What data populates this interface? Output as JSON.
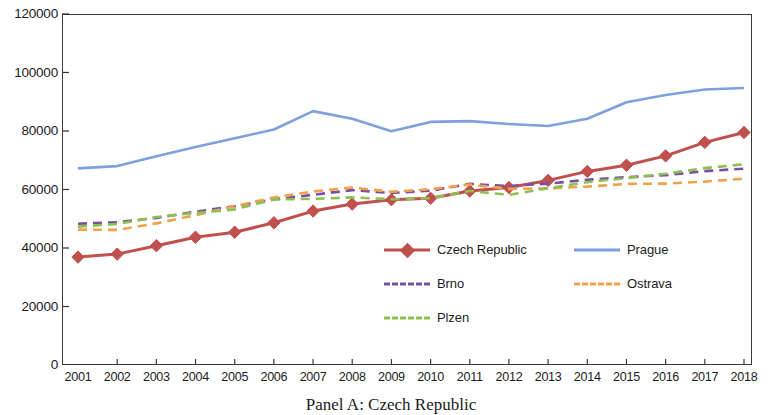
{
  "caption": "Panel A: Czech Republic",
  "axes": {
    "y_ticks": [
      "0",
      "20000",
      "40000",
      "60000",
      "80000",
      "100000",
      "120000"
    ],
    "x_ticks": [
      "2001",
      "2002",
      "2003",
      "2004",
      "2005",
      "2006",
      "2007",
      "2008",
      "2009",
      "2010",
      "2011",
      "2012",
      "2013",
      "2014",
      "2015",
      "2016",
      "2017",
      "2018"
    ],
    "xlabel": "",
    "ylabel": ""
  },
  "legend": {
    "position": "inside-center-lower",
    "entries": [
      {
        "label": "Czech Republic",
        "color": "#C0504D",
        "style": "solid-marker",
        "marker": "diamond"
      },
      {
        "label": "Prague",
        "color": "#7FA0DC",
        "style": "solid",
        "marker": "none"
      },
      {
        "label": "Brno",
        "color": "#7B4FA0",
        "style": "dashed",
        "marker": "none"
      },
      {
        "label": "Ostrava",
        "color": "#F1A14B",
        "style": "dashed",
        "marker": "none"
      },
      {
        "label": "Plzen",
        "color": "#8CC152",
        "style": "dashed",
        "marker": "none"
      }
    ]
  },
  "chart_data": {
    "type": "line",
    "title": "Panel A: Czech Republic",
    "xlabel": "",
    "ylabel": "",
    "grid": false,
    "legend_position": "inside-center-lower",
    "x": [
      2001,
      2002,
      2003,
      2004,
      2005,
      2006,
      2007,
      2008,
      2009,
      2010,
      2011,
      2012,
      2013,
      2014,
      2015,
      2016,
      2017,
      2018
    ],
    "categories": [
      "2001",
      "2002",
      "2003",
      "2004",
      "2005",
      "2006",
      "2007",
      "2008",
      "2009",
      "2010",
      "2011",
      "2012",
      "2013",
      "2014",
      "2015",
      "2016",
      "2017",
      "2018"
    ],
    "ylim": [
      0,
      120000
    ],
    "xlim": [
      2001,
      2018
    ],
    "ytick_step": 20000,
    "series": [
      {
        "name": "Czech Republic",
        "color": "#C0504D",
        "style": "solid",
        "marker": "diamond",
        "values": [
          36900,
          37900,
          40800,
          43700,
          45400,
          48600,
          52600,
          55000,
          56500,
          57000,
          59500,
          60700,
          63100,
          66200,
          68300,
          71500,
          76100,
          79500
        ]
      },
      {
        "name": "Prague",
        "color": "#7FA0DC",
        "style": "solid",
        "marker": "none",
        "values": [
          67200,
          68000,
          71400,
          74500,
          77500,
          80500,
          86800,
          84200,
          79900,
          83100,
          83400,
          82400,
          81700,
          84200,
          89800,
          92300,
          94200,
          94700
        ]
      },
      {
        "name": "Brno",
        "color": "#7B4FA0",
        "style": "dashed",
        "marker": "none",
        "values": [
          48300,
          48800,
          50300,
          52400,
          54300,
          56600,
          58200,
          59800,
          58800,
          59600,
          61900,
          61200,
          62000,
          63300,
          64200,
          64900,
          66300,
          67100
        ]
      },
      {
        "name": "Ostrava",
        "color": "#F1A14B",
        "style": "dashed",
        "marker": "none",
        "values": [
          46300,
          46200,
          48400,
          51200,
          54300,
          57300,
          59300,
          60700,
          59200,
          60100,
          61700,
          60200,
          60400,
          61000,
          61900,
          62000,
          62700,
          63700
        ]
      },
      {
        "name": "Plzen",
        "color": "#8CC152",
        "style": "dashed",
        "marker": "none",
        "values": [
          47300,
          48200,
          50600,
          52000,
          53200,
          56600,
          56800,
          57300,
          56700,
          57000,
          59500,
          58200,
          60400,
          62500,
          63900,
          65400,
          67300,
          68600
        ]
      }
    ]
  }
}
